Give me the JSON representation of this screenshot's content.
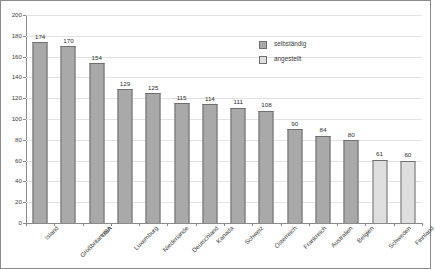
{
  "chart_data": {
    "type": "bar",
    "title": "",
    "xlabel": "",
    "ylabel": "",
    "ylim": [
      0,
      200
    ],
    "ytick_step": 20,
    "yticks": [
      0,
      20,
      40,
      60,
      80,
      100,
      120,
      140,
      160,
      180,
      200
    ],
    "grid": true,
    "legend_position": "top-right",
    "categories": [
      "Island",
      "Großbritannien",
      "USA",
      "Luxemburg",
      "Niederlande",
      "Deutschland",
      "Kanada",
      "Schweiz",
      "Österreich",
      "Frankreich",
      "Australien",
      "Belgien",
      "Schweden",
      "Finnland"
    ],
    "values": [
      174,
      170,
      154,
      129,
      125,
      115,
      114,
      111,
      108,
      90,
      84,
      80,
      61,
      60
    ],
    "series_assignment": [
      "selbstaendig",
      "selbstaendig",
      "selbstaendig",
      "selbstaendig",
      "selbstaendig",
      "selbstaendig",
      "selbstaendig",
      "selbstaendig",
      "selbstaendig",
      "selbstaendig",
      "selbstaendig",
      "selbstaendig",
      "angestellt",
      "angestellt"
    ],
    "series": [
      {
        "name": "selbständig",
        "key": "selbstaendig",
        "color": "#a9a9a9"
      },
      {
        "name": "angestellt",
        "key": "angestellt",
        "color": "#dedede"
      }
    ]
  },
  "legend": {
    "items": [
      {
        "label": "selbständig",
        "key": "selbstaendig"
      },
      {
        "label": "angestellt",
        "key": "angestellt"
      }
    ]
  },
  "colors": {
    "bar_dark": "#a9a9a9",
    "bar_light": "#dedede",
    "bar_border": "#6f6f6f",
    "axis": "#8a8a8a",
    "gridline": "#e2e2e2",
    "frame": "#8c8c8c",
    "text": "#3d3d3d"
  }
}
